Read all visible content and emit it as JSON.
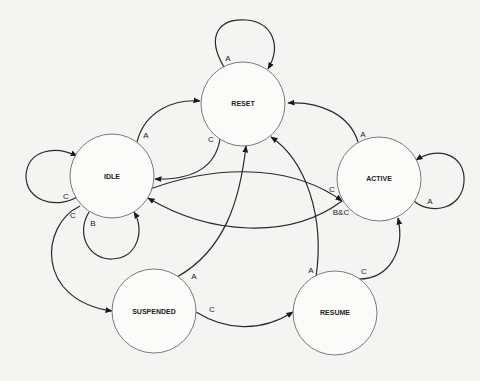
{
  "diagram": {
    "type": "state-machine",
    "background": "#f4f4f2",
    "states": [
      {
        "id": "reset",
        "label": "RESET",
        "cx": 243,
        "cy": 104,
        "r": 42
      },
      {
        "id": "idle",
        "label": "IDLE",
        "cx": 112,
        "cy": 176,
        "r": 42
      },
      {
        "id": "active",
        "label": "ACTIVE",
        "cx": 379,
        "cy": 179,
        "r": 42
      },
      {
        "id": "suspended",
        "label": "SUSPENDED",
        "cx": 154,
        "cy": 311,
        "r": 42
      },
      {
        "id": "resume",
        "label": "RESUME",
        "cx": 335,
        "cy": 313,
        "r": 42
      }
    ],
    "transitions": [
      {
        "from": "RESET",
        "to": "RESET",
        "label": "A"
      },
      {
        "from": "IDLE",
        "to": "RESET",
        "label": "A"
      },
      {
        "from": "RESET",
        "to": "IDLE",
        "label": "C"
      },
      {
        "from": "ACTIVE",
        "to": "RESET",
        "label": "A"
      },
      {
        "from": "ACTIVE",
        "to": "ACTIVE",
        "label": "A"
      },
      {
        "from": "IDLE",
        "to": "IDLE",
        "label": "C"
      },
      {
        "from": "IDLE",
        "to": "IDLE",
        "label": "B"
      },
      {
        "from": "IDLE",
        "to": "SUSPENDED",
        "label": "C"
      },
      {
        "from": "SUSPENDED",
        "to": "RESET",
        "label": "A"
      },
      {
        "from": "RESUME",
        "to": "RESET",
        "label": "A"
      },
      {
        "from": "SUSPENDED",
        "to": "RESUME",
        "label": "C"
      },
      {
        "from": "RESUME",
        "to": "ACTIVE",
        "label": "C"
      },
      {
        "from": "IDLE",
        "to": "ACTIVE",
        "label": "C"
      },
      {
        "from": "ACTIVE",
        "to": "IDLE",
        "label": "B&C"
      }
    ]
  },
  "labels": {
    "reset": "RESET",
    "idle": "IDLE",
    "active": "ACTIVE",
    "suspended": "SUSPENDED",
    "resume": "RESUME",
    "e_reset_self": "A",
    "e_idle_reset": "A",
    "e_reset_idle": "C",
    "e_active_reset": "A",
    "e_active_self": "A",
    "e_idle_self_c": "C",
    "e_idle_self_b": "B",
    "e_idle_suspended": "C",
    "e_suspended_reset": "A",
    "e_resume_reset": "A",
    "e_suspended_resume": "C",
    "e_resume_active": "C",
    "e_idle_active": "C",
    "e_active_idle": "B&C"
  }
}
